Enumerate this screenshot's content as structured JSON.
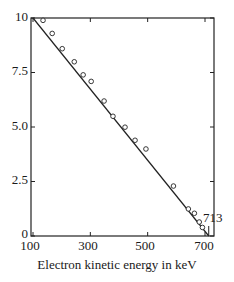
{
  "chart_data": {
    "type": "scatter",
    "title": "",
    "xlabel": "Electron kinetic energy in keV",
    "ylabel": "",
    "xlim": [
      100,
      720
    ],
    "ylim": [
      0,
      10
    ],
    "grid": false,
    "legend": null,
    "x_ticks": [
      "100",
      "300",
      "500",
      "700"
    ],
    "y_ticks": [
      "10",
      "7.5",
      "5.0",
      "2.5",
      "0"
    ],
    "series": [
      {
        "name": "measured points",
        "marker": "open-circle",
        "x": [
          128,
          160,
          195,
          237,
          268,
          296,
          341,
          372,
          414,
          449,
          487,
          583,
          635,
          656,
          673,
          684
        ],
        "y": [
          9.8,
          9.2,
          8.5,
          7.9,
          7.3,
          7.0,
          6.1,
          5.4,
          4.9,
          4.3,
          3.9,
          2.2,
          1.15,
          0.95,
          0.55,
          0.3
        ]
      },
      {
        "name": "linear fit",
        "type": "line",
        "x": [
          100,
          713
        ],
        "y": [
          10.0,
          0
        ]
      }
    ],
    "annotations": [
      {
        "text": "713",
        "x": 713,
        "y": 0.5
      }
    ]
  },
  "labels": {
    "xlabel": "Electron kinetic energy in keV",
    "endpoint": "713",
    "yticks": [
      "10",
      "7.5",
      "5.0",
      "2.5",
      "0"
    ],
    "xticks": [
      "100",
      "300",
      "500",
      "700"
    ]
  }
}
